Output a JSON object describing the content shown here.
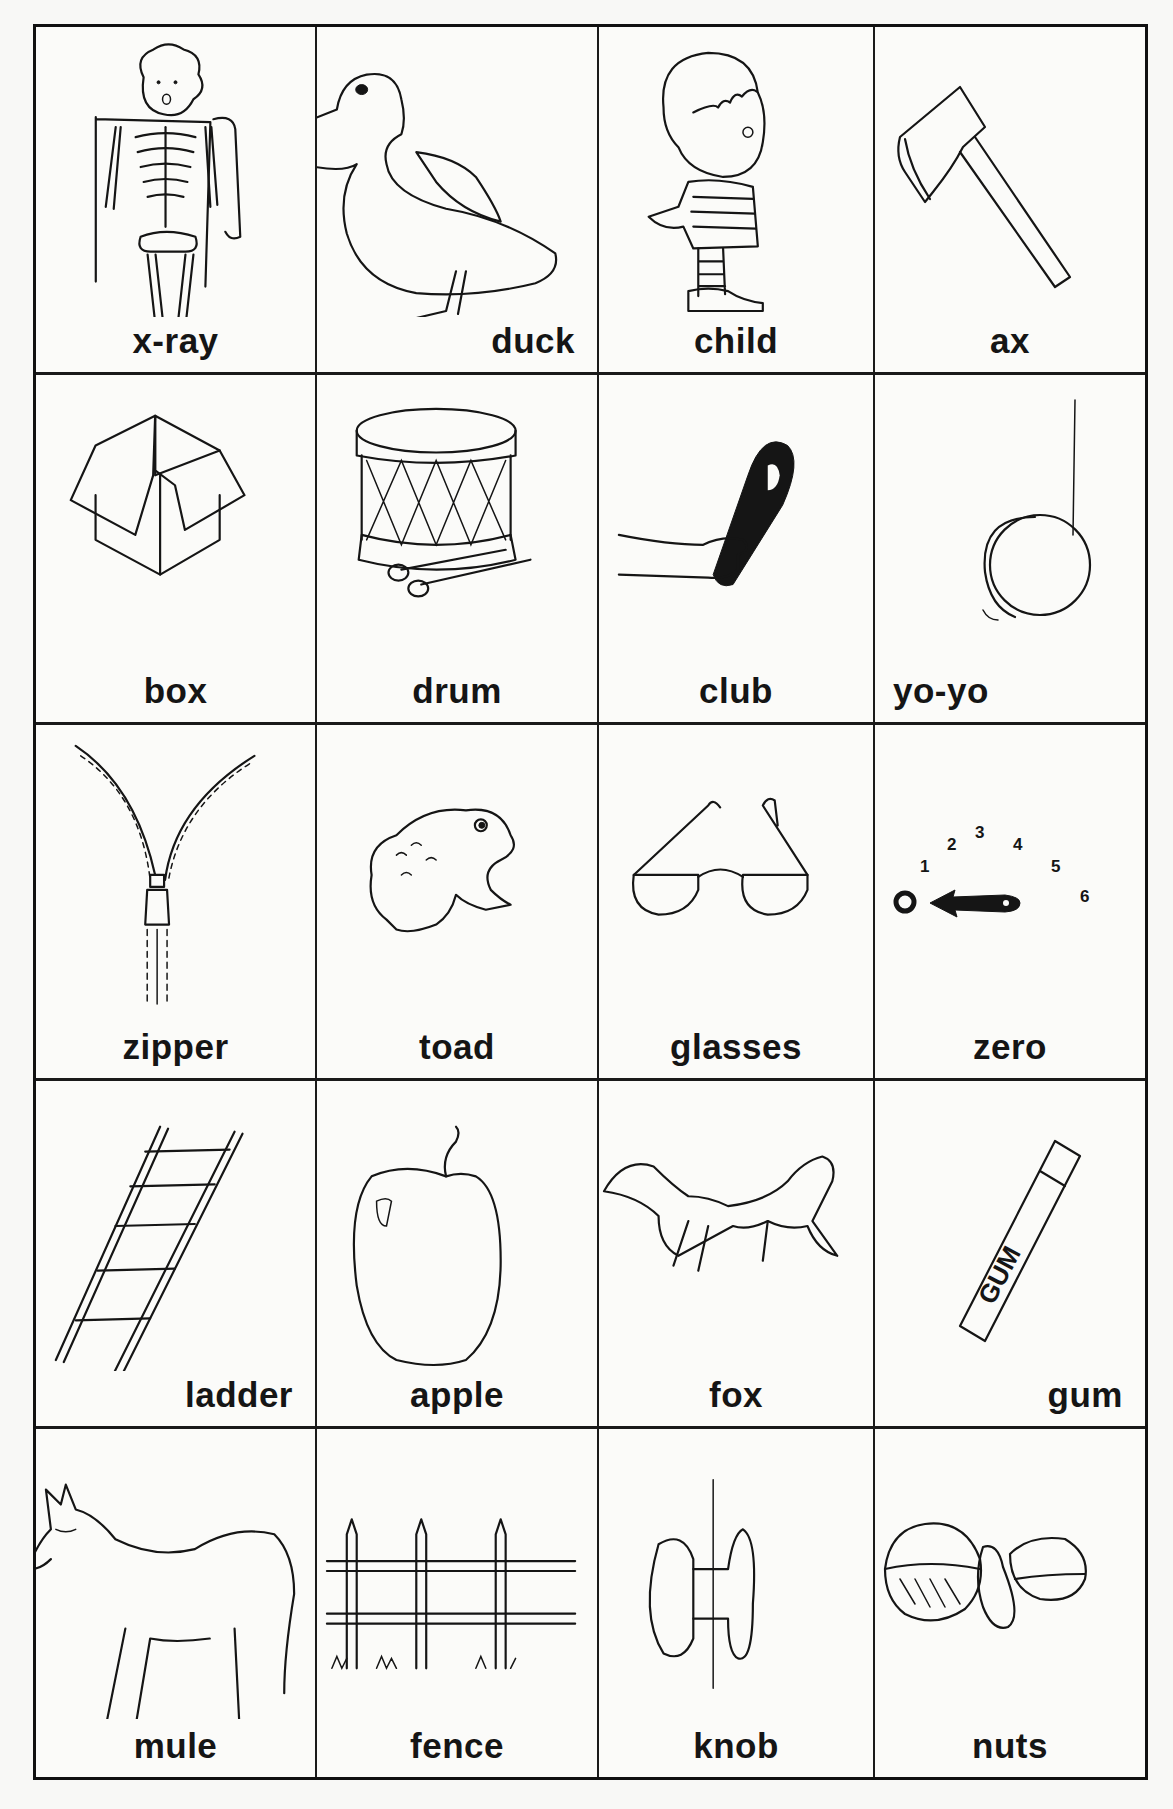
{
  "worksheet": {
    "columns": 4,
    "rows": 5,
    "cells": [
      {
        "row": 1,
        "col": 1,
        "word": "x-ray",
        "picture": "skeleton-xray"
      },
      {
        "row": 1,
        "col": 2,
        "word": "duck",
        "picture": "duck"
      },
      {
        "row": 1,
        "col": 3,
        "word": "child",
        "picture": "child"
      },
      {
        "row": 1,
        "col": 4,
        "word": "ax",
        "picture": "ax"
      },
      {
        "row": 2,
        "col": 1,
        "word": "box",
        "picture": "open-box"
      },
      {
        "row": 2,
        "col": 2,
        "word": "drum",
        "picture": "drum-with-sticks"
      },
      {
        "row": 2,
        "col": 3,
        "word": "club",
        "picture": "hand-holding-club"
      },
      {
        "row": 2,
        "col": 4,
        "word": "yo-yo",
        "picture": "yo-yo-on-string"
      },
      {
        "row": 3,
        "col": 1,
        "word": "zipper",
        "picture": "zipper"
      },
      {
        "row": 3,
        "col": 2,
        "word": "toad",
        "picture": "toad"
      },
      {
        "row": 3,
        "col": 3,
        "word": "glasses",
        "picture": "eyeglasses"
      },
      {
        "row": 3,
        "col": 4,
        "word": "zero",
        "picture": "dial-pointing-to-zero",
        "dial_numbers": [
          "0",
          "1",
          "2",
          "3",
          "4",
          "5",
          "6"
        ]
      },
      {
        "row": 4,
        "col": 1,
        "word": "ladder",
        "picture": "ladder"
      },
      {
        "row": 4,
        "col": 2,
        "word": "apple",
        "picture": "apple"
      },
      {
        "row": 4,
        "col": 3,
        "word": "fox",
        "picture": "fox"
      },
      {
        "row": 4,
        "col": 4,
        "word": "gum",
        "picture": "gum-pack",
        "pack_text": "GUM"
      },
      {
        "row": 5,
        "col": 1,
        "word": "mule",
        "picture": "mule"
      },
      {
        "row": 5,
        "col": 2,
        "word": "fence",
        "picture": "fence"
      },
      {
        "row": 5,
        "col": 3,
        "word": "knob",
        "picture": "door-knob"
      },
      {
        "row": 5,
        "col": 4,
        "word": "nuts",
        "picture": "nuts"
      }
    ]
  }
}
